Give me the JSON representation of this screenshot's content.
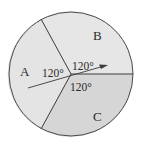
{
  "diagram": {
    "type": "circle-sectors",
    "sectors": [
      {
        "label": "A",
        "angle_label": "120°",
        "fill": "#e4e4e4"
      },
      {
        "label": "B",
        "angle_label": "120°",
        "fill": "#e4e4e4"
      },
      {
        "label": "C",
        "angle_label": "120°",
        "fill": "#d6d6d6"
      }
    ],
    "arrow": {
      "description": "arrow through center pointing into sector B"
    },
    "stroke_color": "#4a4a4a"
  }
}
